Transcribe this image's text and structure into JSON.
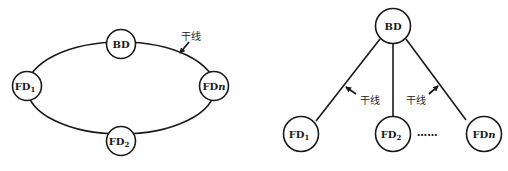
{
  "ring_topology": {
    "nodes": [
      {
        "id": "BD",
        "label": "BD",
        "sub": ""
      },
      {
        "id": "FD1",
        "label": "FD",
        "sub": "1"
      },
      {
        "id": "FDn",
        "label": "FD",
        "italic": "n"
      },
      {
        "id": "FD2",
        "label": "FD",
        "sub": "2"
      }
    ],
    "trunk_label": "干线"
  },
  "tree_topology": {
    "nodes": [
      {
        "id": "BD",
        "label": "BD",
        "sub": ""
      },
      {
        "id": "FD1",
        "label": "FD",
        "sub": "1"
      },
      {
        "id": "FD2",
        "label": "FD",
        "sub": "2"
      },
      {
        "id": "FDn",
        "label": "FD",
        "italic": "n"
      }
    ],
    "trunk_label_left": "干线",
    "trunk_label_right": "干线",
    "ellipsis": "……"
  },
  "colors": {
    "line": "#1a1a1a",
    "background": "#ffffff"
  }
}
